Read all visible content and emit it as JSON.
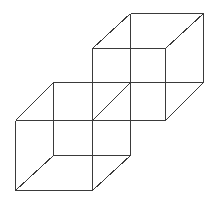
{
  "diagram": {
    "stroke_color": "#3a3a3a",
    "background": "#ffffff",
    "cubes": [
      {
        "name": "upper-right-cube",
        "edges": [
          [
            92,
            48,
            165,
            48
          ],
          [
            165,
            48,
            165,
            120
          ],
          [
            165,
            120,
            92,
            120
          ],
          [
            92,
            120,
            92,
            48
          ],
          [
            130,
            13,
            203,
            13
          ],
          [
            203,
            13,
            203,
            82
          ],
          [
            203,
            82,
            130,
            82
          ],
          [
            130,
            82,
            130,
            13
          ],
          [
            92,
            48,
            130,
            13
          ],
          [
            165,
            48,
            203,
            13
          ],
          [
            165,
            120,
            203,
            82
          ],
          [
            92,
            120,
            130,
            82
          ]
        ]
      },
      {
        "name": "lower-left-cube",
        "edges": [
          [
            15,
            120,
            92,
            120
          ],
          [
            92,
            120,
            92,
            190
          ],
          [
            92,
            190,
            15,
            190
          ],
          [
            15,
            190,
            15,
            120
          ],
          [
            53,
            82,
            130,
            82
          ],
          [
            130,
            82,
            130,
            155
          ],
          [
            130,
            155,
            53,
            155
          ],
          [
            53,
            155,
            53,
            82
          ],
          [
            15,
            120,
            53,
            82
          ],
          [
            92,
            120,
            130,
            82
          ],
          [
            92,
            190,
            130,
            155
          ],
          [
            15,
            190,
            53,
            155
          ]
        ]
      }
    ]
  }
}
